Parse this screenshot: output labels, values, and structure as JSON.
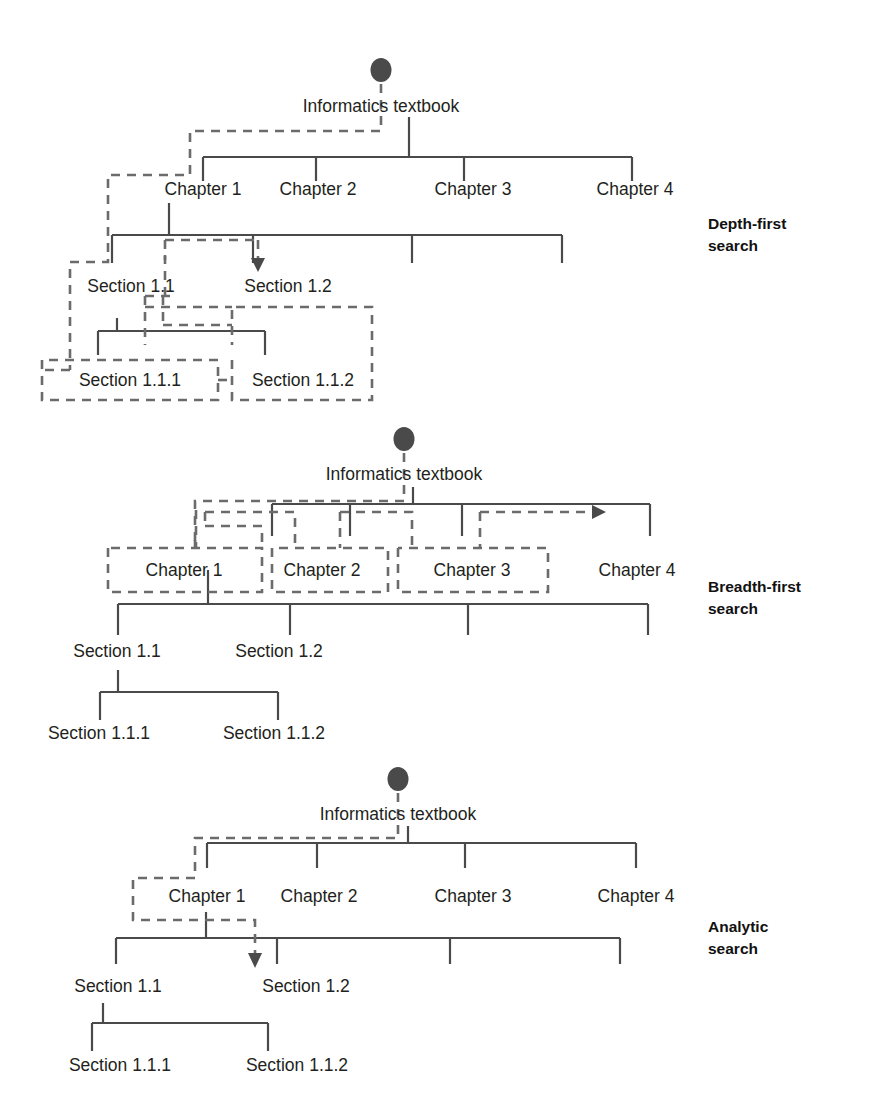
{
  "figure": {
    "diagram_count": 3
  },
  "tree": {
    "root": "Informatics textbook",
    "level1": [
      "Chapter 1",
      "Chapter 2",
      "Chapter 3",
      "Chapter 4"
    ],
    "level2": [
      "Section 1.1",
      "Section 1.2"
    ],
    "level3": [
      "Section 1.1.1",
      "Section 1.1.2"
    ]
  },
  "diagrams": [
    {
      "id": "depth-first",
      "side_label_line1": "Depth-first",
      "side_label_line2": "search",
      "root": "Informatics textbook",
      "chapters": [
        "Chapter 1",
        "Chapter 2",
        "Chapter 3",
        "Chapter 4"
      ],
      "sections": [
        "Section 1.1",
        "Section 1.2"
      ],
      "subsections": [
        "Section 1.1.1",
        "Section 1.1.2"
      ],
      "traversal_order": [
        "Informatics textbook",
        "Chapter 1",
        "Section 1.1",
        "Section 1.1.1",
        "Section 1.1.2",
        "Section 1.2"
      ]
    },
    {
      "id": "breadth-first",
      "side_label_line1": "Breadth-first",
      "side_label_line2": "search",
      "root": "Informatics textbook",
      "chapters": [
        "Chapter 1",
        "Chapter 2",
        "Chapter 3",
        "Chapter 4"
      ],
      "sections": [
        "Section 1.1",
        "Section 1.2"
      ],
      "subsections": [
        "Section 1.1.1",
        "Section 1.1.2"
      ],
      "traversal_order": [
        "Informatics textbook",
        "Chapter 1",
        "Chapter 2",
        "Chapter 3",
        "Chapter 4"
      ]
    },
    {
      "id": "analytic",
      "side_label_line1": "Analytic",
      "side_label_line2": "search",
      "root": "Informatics textbook",
      "chapters": [
        "Chapter 1",
        "Chapter 2",
        "Chapter 3",
        "Chapter 4"
      ],
      "sections": [
        "Section 1.1",
        "Section 1.2"
      ],
      "subsections": [
        "Section 1.1.1",
        "Section 1.1.2"
      ],
      "traversal_order": [
        "Informatics textbook",
        "Chapter 1",
        "Section 1.2"
      ]
    }
  ],
  "colors": {
    "solid_line": "#4a4a4a",
    "dashed_line": "#6b6b6b",
    "text": "#231f20",
    "node_dot": "#4a4a4a",
    "background": "#ffffff"
  },
  "icons": {
    "root_node": "filled-ellipse-node",
    "path_end": "arrowhead-marker"
  }
}
